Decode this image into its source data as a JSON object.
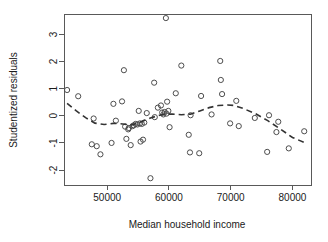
{
  "chart_data": {
    "type": "scatter",
    "title": "",
    "xlabel": "Median household income",
    "ylabel": "Studentized residuals",
    "xlim": [
      43000,
      83000
    ],
    "ylim": [
      -2.55,
      3.75
    ],
    "xticks": [
      50000,
      60000,
      70000,
      80000
    ],
    "xtick_labels": [
      "50000",
      "60000",
      "70000",
      "80000"
    ],
    "yticks": [
      -2,
      -1,
      0,
      1,
      2,
      3
    ],
    "ytick_labels": [
      "-2",
      "-1",
      "0",
      "1",
      "2",
      "3"
    ],
    "grid": false,
    "legend": null,
    "marker": "open-circle",
    "point_color": "#4d4d4d",
    "smoother_color": "#333333",
    "smoother_style": "dashed",
    "smoother_name": "lowess",
    "x": [
      43500,
      45300,
      47500,
      47800,
      48300,
      48900,
      50700,
      51000,
      51400,
      52400,
      52700,
      52900,
      53100,
      53400,
      53500,
      53800,
      54100,
      54300,
      54600,
      54900,
      55100,
      55300,
      55400,
      55600,
      55800,
      56000,
      56400,
      57000,
      57600,
      57700,
      58200,
      58700,
      58900,
      59100,
      59300,
      59500,
      59600,
      59700,
      59900,
      60100,
      61100,
      62000,
      63200,
      63400,
      63500,
      64900,
      65200,
      66900,
      68300,
      68400,
      68600,
      69900,
      70900,
      71300,
      73900,
      75900,
      76200,
      77400,
      77700,
      79400,
      81900
    ],
    "y": [
      0.95,
      0.72,
      -1.05,
      -0.1,
      -1.12,
      -1.42,
      -1.0,
      0.44,
      -0.18,
      0.53,
      1.68,
      -0.4,
      -0.85,
      -0.5,
      -0.45,
      -1.08,
      -0.38,
      -0.35,
      -0.3,
      -0.32,
      0.18,
      -0.28,
      -0.95,
      -0.3,
      -0.88,
      -0.25,
      0.1,
      -2.3,
      1.22,
      -0.05,
      0.3,
      0.38,
      0.12,
      0.05,
      0.14,
      3.6,
      0.08,
      0.52,
      0.18,
      -0.42,
      0.83,
      1.85,
      -0.7,
      -1.35,
      0.02,
      -1.38,
      0.73,
      0.05,
      2.02,
      1.32,
      0.8,
      -0.28,
      0.55,
      -0.38,
      -0.08,
      -1.33,
      0.02,
      -0.6,
      -0.22,
      -1.2,
      -0.57
    ],
    "smoother_x": [
      43500,
      45000,
      46500,
      48000,
      49500,
      51000,
      52500,
      54000,
      55500,
      57000,
      58500,
      59500,
      60500,
      62000,
      63500,
      65000,
      66500,
      68000,
      69500,
      70500,
      72000,
      74000,
      76000,
      78000,
      80000,
      81900
    ],
    "smoother_y": [
      0.46,
      0.18,
      -0.07,
      -0.27,
      -0.32,
      -0.28,
      -0.3,
      -0.34,
      -0.22,
      -0.08,
      0.02,
      0.06,
      0.06,
      0.04,
      0.06,
      0.18,
      0.3,
      0.38,
      0.4,
      0.38,
      0.27,
      0.08,
      -0.18,
      -0.48,
      -0.8,
      -0.98
    ]
  },
  "plot": {
    "box": {
      "left": 64,
      "right": 311,
      "top": 14,
      "bottom": 185
    }
  }
}
